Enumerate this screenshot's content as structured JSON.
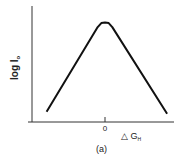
{
  "chart_data": {
    "type": "line",
    "title": "",
    "panel_label": "(a)",
    "xlabel": "△ G",
    "xlabel_subscript": "H",
    "ylabel": "log I",
    "ylabel_subscript": "o",
    "x_ticks": [
      {
        "value": 0,
        "label": "0"
      }
    ],
    "xlim": [
      -1.0,
      1.0
    ],
    "ylim": [
      0,
      1.0
    ],
    "grid": false,
    "legend": "none",
    "series": [
      {
        "name": "curve",
        "x": [
          -0.8,
          -0.1,
          -0.05,
          0.0,
          0.05,
          0.1,
          0.85
        ],
        "y": [
          0.1,
          0.93,
          0.97,
          0.975,
          0.97,
          0.93,
          0.08
        ]
      }
    ]
  }
}
